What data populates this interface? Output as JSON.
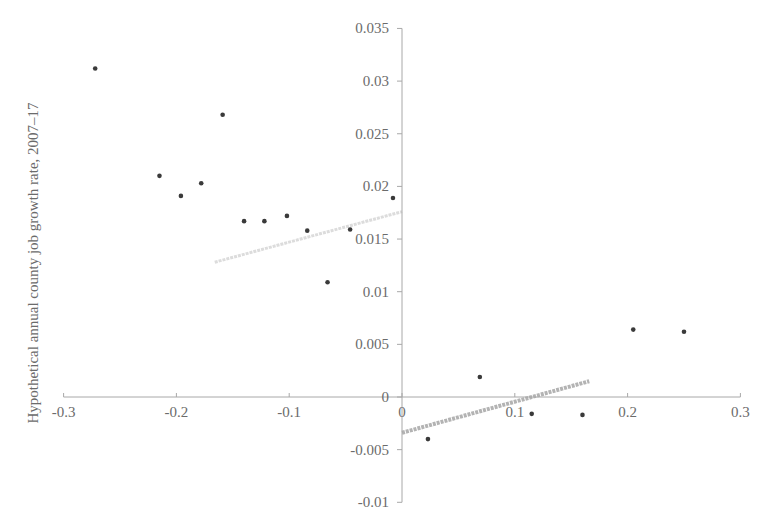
{
  "chart_data": {
    "type": "scatter",
    "title": "",
    "xlabel": "",
    "ylabel": "Hypothetical annual county job growth rate, 2007–17",
    "xlim": [
      -0.3,
      0.3
    ],
    "ylim": [
      -0.01,
      0.035
    ],
    "grid": false,
    "legend": null,
    "x_ticks": [
      -0.3,
      -0.2,
      -0.1,
      0,
      0.1,
      0.2,
      0.3
    ],
    "x_tick_labels": [
      "-0.3",
      "-0.2",
      "-0.1",
      "0",
      "0.1",
      "0.2",
      "0.3"
    ],
    "y_ticks": [
      0.035,
      0.03,
      0.025,
      0.02,
      0.015,
      0.01,
      0.005,
      0,
      -0.005,
      -0.01
    ],
    "y_tick_labels": [
      "0.035",
      "0.03",
      "0.025",
      "0.02",
      "0.015",
      "0.01",
      "0.005",
      "0",
      "-0.005",
      "-0.01"
    ],
    "series": [
      {
        "name": "counties",
        "color": "#3a3a3a",
        "points": [
          {
            "x": -0.272,
            "y": 0.0312
          },
          {
            "x": -0.215,
            "y": 0.021
          },
          {
            "x": -0.196,
            "y": 0.0191
          },
          {
            "x": -0.178,
            "y": 0.0203
          },
          {
            "x": -0.159,
            "y": 0.0268
          },
          {
            "x": -0.14,
            "y": 0.0167
          },
          {
            "x": -0.122,
            "y": 0.0167
          },
          {
            "x": -0.102,
            "y": 0.0172
          },
          {
            "x": -0.084,
            "y": 0.0158
          },
          {
            "x": -0.066,
            "y": 0.0109
          },
          {
            "x": -0.046,
            "y": 0.0159
          },
          {
            "x": -0.008,
            "y": 0.0189
          },
          {
            "x": 0.023,
            "y": -0.004
          },
          {
            "x": 0.069,
            "y": 0.0019
          },
          {
            "x": 0.115,
            "y": -0.0016
          },
          {
            "x": 0.16,
            "y": -0.0017
          },
          {
            "x": 0.205,
            "y": 0.0064
          },
          {
            "x": 0.25,
            "y": 0.0062
          }
        ]
      }
    ],
    "trendlines": [
      {
        "name": "left-fit",
        "color": "#dcdcdc",
        "width": 3,
        "x1": -0.166,
        "y1": 0.0128,
        "x2": 0.0,
        "y2": 0.0176
      },
      {
        "name": "right-fit",
        "color": "#b3b3b3",
        "width": 4,
        "x1": 0.0,
        "y1": -0.0034,
        "x2": 0.166,
        "y2": 0.0015
      }
    ]
  },
  "layout": {
    "origin_px": [
      402,
      397
    ],
    "x_px_per_unit": 1128,
    "y_px_per_unit": 10530
  }
}
